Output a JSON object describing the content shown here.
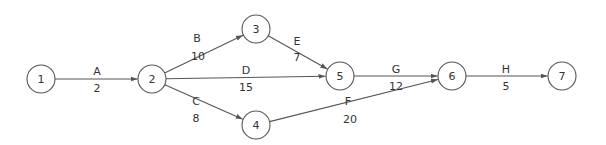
{
  "diagram": {
    "type": "activity-on-arrow network",
    "nodes": [
      {
        "id": "1",
        "label": "1",
        "x": 41,
        "y": 79
      },
      {
        "id": "2",
        "label": "2",
        "x": 152,
        "y": 79
      },
      {
        "id": "3",
        "label": "3",
        "x": 256,
        "y": 29
      },
      {
        "id": "4",
        "label": "4",
        "x": 256,
        "y": 125
      },
      {
        "id": "5",
        "label": "5",
        "x": 340,
        "y": 76
      },
      {
        "id": "6",
        "label": "6",
        "x": 452,
        "y": 76
      },
      {
        "id": "7",
        "label": "7",
        "x": 562,
        "y": 76
      }
    ],
    "edges": [
      {
        "activity": "A",
        "duration": "2",
        "from": "1",
        "to": "2",
        "name_pos": [
          97,
          71
        ],
        "dur_pos": [
          97,
          88
        ]
      },
      {
        "activity": "B",
        "duration": "10",
        "from": "2",
        "to": "3",
        "name_pos": [
          197,
          38
        ],
        "dur_pos": [
          198,
          56
        ]
      },
      {
        "activity": "C",
        "duration": "8",
        "from": "2",
        "to": "4",
        "name_pos": [
          196,
          101
        ],
        "dur_pos": [
          196,
          118
        ]
      },
      {
        "activity": "D",
        "duration": "15",
        "from": "2",
        "to": "5",
        "name_pos": [
          246,
          70
        ],
        "dur_pos": [
          246,
          87
        ]
      },
      {
        "activity": "E",
        "duration": "7",
        "from": "3",
        "to": "5",
        "name_pos": [
          297,
          41
        ],
        "dur_pos": [
          297,
          57
        ]
      },
      {
        "activity": "F",
        "duration": "20",
        "from": "4",
        "to": "6",
        "name_pos": [
          348,
          101
        ],
        "dur_pos": [
          350,
          119
        ]
      },
      {
        "activity": "G",
        "duration": "12",
        "from": "5",
        "to": "6",
        "name_pos": [
          396,
          69
        ],
        "dur_pos": [
          396,
          86
        ]
      },
      {
        "activity": "H",
        "duration": "5",
        "from": "6",
        "to": "7",
        "name_pos": [
          506,
          69
        ],
        "dur_pos": [
          506,
          86
        ]
      }
    ],
    "colors": {
      "stroke": "#555555",
      "text": "#333333",
      "background": "#ffffff"
    }
  }
}
